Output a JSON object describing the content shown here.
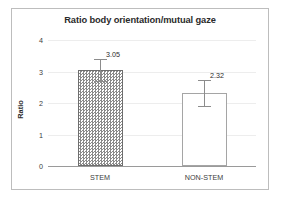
{
  "chart_data": {
    "type": "bar",
    "title": "Ratio body orientation/mutual gaze",
    "xlabel": "",
    "ylabel": "Ratio",
    "categories": [
      "STEM",
      "NON-STEM"
    ],
    "values": [
      3.05,
      2.32
    ],
    "data_labels": [
      "3.05",
      "2.32"
    ],
    "errors": [
      0.36,
      0.4
    ],
    "ylim": [
      0,
      4
    ],
    "yticks": [
      0,
      1,
      2,
      3,
      4
    ],
    "ytick_labels": [
      "0",
      "1",
      "2",
      "3",
      "4"
    ],
    "grid": true,
    "legend": false,
    "series": [
      {
        "name": "Ratio",
        "values": [
          3.05,
          2.32
        ],
        "errors": [
          0.36,
          0.4
        ],
        "styles": [
          "hatched",
          "hollow"
        ]
      }
    ],
    "colors": {
      "bar_fill_stem": "#8a8a8a",
      "bar_fill_nonstem": "#ffffff",
      "bar_border": "#6e6e6e",
      "gridline": "#ededed",
      "axis": "#9a9a9a",
      "error_bar": "#8c8c8c",
      "text": "#2b2b2b",
      "frame": "#bdbdbd"
    }
  }
}
